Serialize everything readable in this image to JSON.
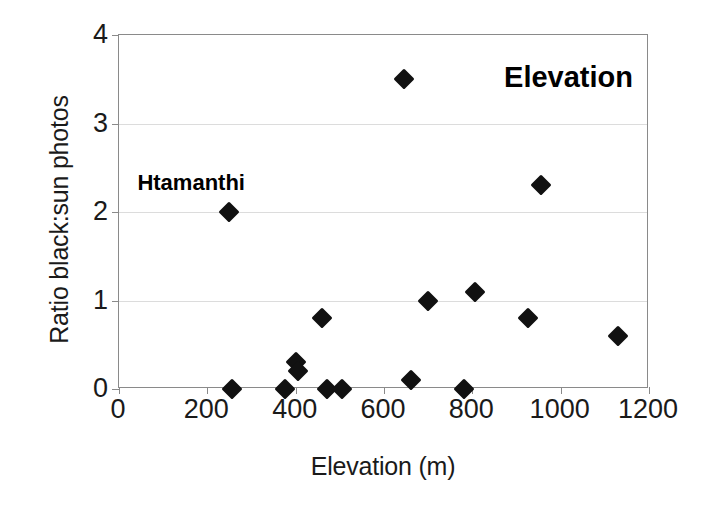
{
  "chart_data": {
    "type": "scatter",
    "title": "Elevation",
    "xlabel": "Elevation (m)",
    "ylabel": "Ratio black:sun photos",
    "xlim": [
      0,
      1200
    ],
    "ylim": [
      0,
      4
    ],
    "xticks": [
      0,
      200,
      400,
      600,
      800,
      1000,
      1200
    ],
    "yticks": [
      0,
      1,
      2,
      3,
      4
    ],
    "grid": "horizontal",
    "legend": "none",
    "marker": "filled-diamond",
    "marker_color": "#111111",
    "frame_color": "#8a8a8a",
    "gridline_color": "#dcdcdc",
    "x": [
      250,
      255,
      375,
      400,
      405,
      460,
      470,
      505,
      645,
      660,
      700,
      780,
      805,
      925,
      955,
      1130
    ],
    "y": [
      2.0,
      0.0,
      0.0,
      0.3,
      0.2,
      0.8,
      0.0,
      0.0,
      3.5,
      0.1,
      1.0,
      0.0,
      1.1,
      0.8,
      2.3,
      0.6
    ],
    "points": [
      {
        "x": 250,
        "y": 2.0,
        "label": "Htamanthi"
      },
      {
        "x": 255,
        "y": 0.0,
        "label": ""
      },
      {
        "x": 375,
        "y": 0.0,
        "label": ""
      },
      {
        "x": 400,
        "y": 0.3,
        "label": ""
      },
      {
        "x": 405,
        "y": 0.2,
        "label": ""
      },
      {
        "x": 460,
        "y": 0.8,
        "label": ""
      },
      {
        "x": 470,
        "y": 0.0,
        "label": ""
      },
      {
        "x": 505,
        "y": 0.0,
        "label": ""
      },
      {
        "x": 645,
        "y": 3.5,
        "label": ""
      },
      {
        "x": 660,
        "y": 0.1,
        "label": ""
      },
      {
        "x": 700,
        "y": 1.0,
        "label": ""
      },
      {
        "x": 780,
        "y": 0.0,
        "label": ""
      },
      {
        "x": 805,
        "y": 1.1,
        "label": ""
      },
      {
        "x": 925,
        "y": 0.8,
        "label": ""
      },
      {
        "x": 955,
        "y": 2.3,
        "label": ""
      },
      {
        "x": 1130,
        "y": 0.6,
        "label": ""
      }
    ],
    "annotations": [
      {
        "text": "Htamanthi",
        "x": 250,
        "y": 2.0,
        "placement": "above-left"
      }
    ]
  }
}
